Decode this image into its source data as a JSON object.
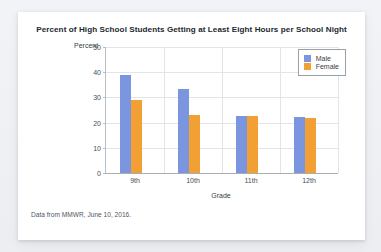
{
  "card": {
    "source_note": "Data from MMWR, June 10, 2016."
  },
  "chart_data": {
    "type": "bar",
    "title": "Percent of High School Students Getting at Least Eight Hours per School Night",
    "xlabel": "Grade",
    "ylabel": "Percent",
    "categories": [
      "9th",
      "10th",
      "11th",
      "12th"
    ],
    "series": [
      {
        "name": "Male",
        "color": "#7b95de",
        "values": [
          39,
          33.5,
          22.7,
          22.2
        ]
      },
      {
        "name": "Female",
        "color": "#f2a034",
        "values": [
          29,
          23,
          22.7,
          21.8
        ]
      }
    ],
    "ylim": [
      0,
      50
    ],
    "yticks": [
      0,
      10,
      20,
      30,
      40,
      50
    ],
    "grid": true,
    "legend_position": "top-right"
  }
}
